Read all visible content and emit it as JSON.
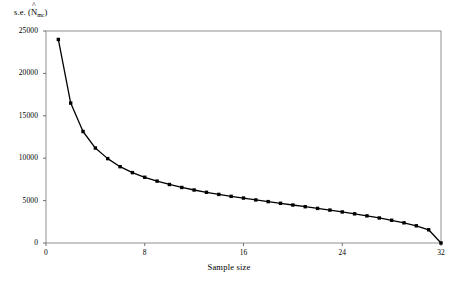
{
  "chart_data": {
    "type": "line",
    "title": "",
    "xlabel": "Sample size",
    "ylabel_text": "s.e. (",
    "ylabel_symbol": "N",
    "ylabel_hat": "^",
    "ylabel_subscript": "mc",
    "ylabel_close": ")",
    "ylabel_full": "s.e. (N̂mc)",
    "xlim": [
      0,
      32
    ],
    "ylim": [
      0,
      25000
    ],
    "grid": false,
    "legend": null,
    "marker": "filled-square",
    "line_color": "#000000",
    "frame_color": "#808080",
    "xticks": [
      0,
      8,
      16,
      24,
      32
    ],
    "xticklabels": [
      "0",
      "8",
      "16",
      "24",
      "32"
    ],
    "yticks": [
      0,
      5000,
      10000,
      15000,
      20000,
      25000
    ],
    "yticklabels": [
      "0",
      "5000",
      "10000",
      "15000",
      "20000",
      "25000"
    ],
    "x": [
      1,
      2,
      3,
      4,
      5,
      6,
      7,
      8,
      9,
      10,
      11,
      12,
      13,
      14,
      15,
      16,
      17,
      18,
      19,
      20,
      21,
      22,
      23,
      24,
      25,
      26,
      27,
      28,
      29,
      30,
      31,
      32
    ],
    "values": [
      24000,
      16500,
      13150,
      11200,
      9950,
      9000,
      8300,
      7750,
      7300,
      6900,
      6550,
      6250,
      5980,
      5730,
      5500,
      5300,
      5080,
      4880,
      4680,
      4480,
      4280,
      4080,
      3880,
      3660,
      3440,
      3200,
      2950,
      2680,
      2380,
      2030,
      1560,
      0
    ]
  }
}
